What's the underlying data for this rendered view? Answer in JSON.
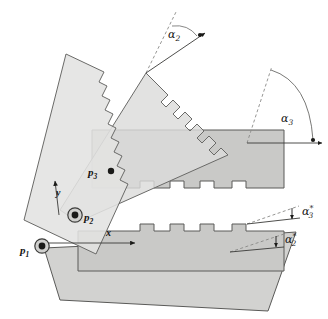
{
  "figure": {
    "type": "kinematic-linkage-diagram",
    "background_color": "#ffffff",
    "ink_color": "#141414"
  },
  "palette": {
    "link_light_fill": "#e3e3e1",
    "link_mid_fill": "#d8d8d6",
    "link_dark_fill": "#c9c9c7",
    "link_overlap_fill": "#bcbcba",
    "outline": "#5a5a58",
    "leader_line": "#7d7d7b",
    "joint_ring": "#3c3c3a",
    "joint_core": "#1a1a18"
  },
  "joints": [
    {
      "id": "p1",
      "label": "p",
      "subscript": "1",
      "x": 42,
      "y": 246,
      "style": "revolute-ringed",
      "label_x": 20,
      "label_y": 254
    },
    {
      "id": "p2",
      "label": "p",
      "subscript": "2",
      "x": 75,
      "y": 215,
      "style": "revolute-ringed",
      "label_x": 84,
      "label_y": 221
    },
    {
      "id": "p3",
      "label": "p",
      "subscript": "3",
      "x": 111,
      "y": 171,
      "style": "point-dot",
      "label_x": 88,
      "label_y": 176
    }
  ],
  "axes": [
    {
      "id": "y-axis",
      "label": "y",
      "direction": "up",
      "label_x": 56,
      "label_y": 196,
      "tail_x": 59,
      "tail_y": 215,
      "head_x": 55,
      "head_y": 180
    },
    {
      "id": "x-axis",
      "label": "x",
      "direction": "right",
      "label_x": 106,
      "label_y": 236,
      "tail_x": 46,
      "tail_y": 243,
      "head_x": 135,
      "head_y": 243
    }
  ],
  "angles": [
    {
      "id": "alpha2",
      "label": "α",
      "subscript": "2",
      "starred": false,
      "label_x": 168,
      "label_y": 38,
      "apex_x": 146,
      "apex_y": 73,
      "description": "Angle at tip of diagonal link between dashed reference ray and solid arrowed ray"
    },
    {
      "id": "alpha3",
      "label": "α",
      "subscript": "3",
      "starred": false,
      "label_x": 281,
      "label_y": 122,
      "apex_x": 247,
      "apex_y": 143,
      "description": "Large arc angle between vertical dashed reference and horizontal link axis"
    },
    {
      "id": "alpha3star",
      "label": "α",
      "subscript": "3",
      "starred": true,
      "label_x": 302,
      "label_y": 215,
      "apex_x": 247,
      "apex_y": 224,
      "description": "Small wedge angle marked with asterisk, upper of the two starred angles"
    },
    {
      "id": "alpha2star",
      "label": "α",
      "subscript": "2",
      "starred": true,
      "label_x": 285,
      "label_y": 243,
      "apex_x": 230,
      "apex_y": 252,
      "description": "Small wedge angle marked with asterisk, lower of the two starred angles"
    }
  ],
  "links": [
    {
      "id": "link-left",
      "description": "Steeply tilted light link on far left with stepped teeth on right edge",
      "fill": "#e3e3e1"
    },
    {
      "id": "link-diagonal",
      "description": "Long diagonal link rising to upper right with stepped teeth, carries alpha2",
      "fill": "#dcdcda"
    },
    {
      "id": "link-upper-bar",
      "description": "Upper horizontal bar with square crenellations along bottom edge",
      "fill": "#c9c9c7"
    },
    {
      "id": "link-lower-bar",
      "description": "Lower horizontal bar with square crenellations along top edge",
      "fill": "#c9c9c7"
    },
    {
      "id": "link-bottom",
      "description": "Bottom link tilted down to the right with square crenellations along top edge",
      "fill": "#d2d2d0"
    }
  ]
}
